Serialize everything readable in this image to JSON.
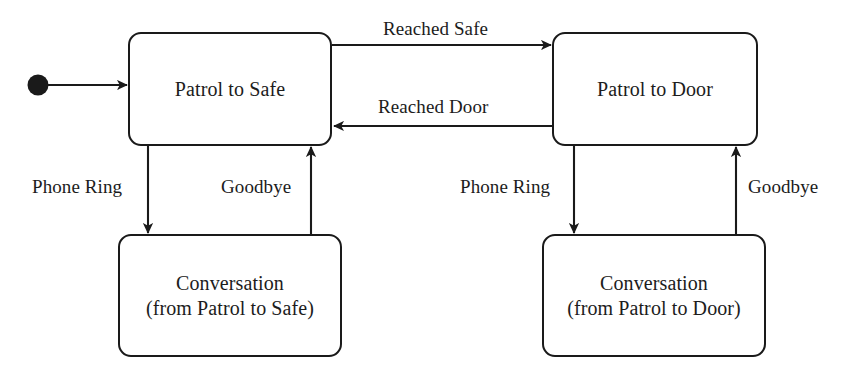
{
  "diagram": {
    "type": "state-machine",
    "colors": {
      "stroke": "#1a1a1a",
      "text": "#1c1c1c",
      "background": "#ffffff"
    },
    "initial_state_marker": "filled-circle",
    "states": [
      {
        "id": "patrol-to-safe",
        "label": "Patrol to Safe",
        "x": 128,
        "y": 32,
        "width": 204,
        "height": 114
      },
      {
        "id": "patrol-to-door",
        "label": "Patrol to Door",
        "x": 552,
        "y": 32,
        "width": 206,
        "height": 114
      },
      {
        "id": "conversation-from-patrol-to-safe",
        "label": "Conversation\n(from Patrol to Safe)",
        "x": 118,
        "y": 234,
        "width": 224,
        "height": 123
      },
      {
        "id": "conversation-from-patrol-to-door",
        "label": "Conversation\n(from Patrol to Door)",
        "x": 542,
        "y": 234,
        "width": 224,
        "height": 123
      }
    ],
    "transitions": [
      {
        "id": "initial-to-patrol-to-safe",
        "label": "",
        "from": "initial",
        "to": "patrol-to-safe"
      },
      {
        "id": "reached-safe",
        "label": "Reached Safe",
        "from": "patrol-to-safe",
        "to": "patrol-to-door"
      },
      {
        "id": "reached-door",
        "label": "Reached Door",
        "from": "patrol-to-door",
        "to": "patrol-to-safe"
      },
      {
        "id": "phone-ring-left",
        "label": "Phone Ring",
        "from": "patrol-to-safe",
        "to": "conversation-from-patrol-to-safe"
      },
      {
        "id": "goodbye-left",
        "label": "Goodbye",
        "from": "conversation-from-patrol-to-safe",
        "to": "patrol-to-safe"
      },
      {
        "id": "phone-ring-right",
        "label": "Phone Ring",
        "from": "patrol-to-door",
        "to": "conversation-from-patrol-to-door"
      },
      {
        "id": "goodbye-right",
        "label": "Goodbye",
        "from": "conversation-from-patrol-to-door",
        "to": "patrol-to-door"
      }
    ],
    "labels": {
      "reached_safe": "Reached Safe",
      "reached_door": "Reached Door",
      "phone_ring_left": "Phone Ring",
      "goodbye_left": "Goodbye",
      "phone_ring_right": "Phone Ring",
      "goodbye_right": "Goodbye"
    }
  }
}
